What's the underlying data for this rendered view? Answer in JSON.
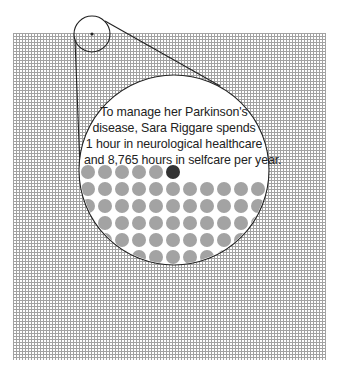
{
  "caption": {
    "lines": [
      "To manage her Parkinson's",
      "disease, Sara Riggare spends",
      "1 hour in neurological healthcare",
      "and 8,765 hours in selfcare per year."
    ]
  },
  "figure": {
    "grid_field": {
      "cell_px": 3,
      "color": "#a2a2a2",
      "meaning": "hours in a year"
    },
    "magnifier_small": {
      "cx": 92,
      "cy": 34,
      "r": 18
    },
    "magnifier_large": {
      "cx": 174,
      "cy": 170,
      "r": 95
    },
    "dots": {
      "gray_color": "#a3a3a3",
      "highlight_color": "#333333",
      "diameter": 14,
      "spacing": 17,
      "first_row_count": 6,
      "highlight_index_in_first_row": 5,
      "highlight_meaning": "1 hour neurological healthcare"
    }
  }
}
